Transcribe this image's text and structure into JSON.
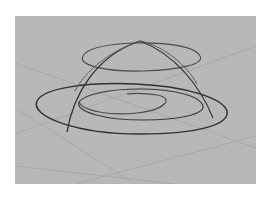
{
  "figure": {
    "colors": {
      "background": "#ffffff",
      "viewport": "#b7b8ba",
      "grid_line": "#a5a6a9",
      "curve_dark": "#2e2e30",
      "curve_mid": "#4a4a4d"
    },
    "elements": [
      {
        "name": "outer-spiral-ring",
        "kind": "ellipse-like curve"
      },
      {
        "name": "middle-spiral-ring",
        "kind": "ellipse-like curve"
      },
      {
        "name": "inner-spiral-end",
        "kind": "spiral hook"
      },
      {
        "name": "upper-dome-ellipse",
        "kind": "elevated ellipse"
      },
      {
        "name": "dome-arc-left",
        "kind": "arc"
      },
      {
        "name": "dome-arc-right",
        "kind": "arc"
      },
      {
        "name": "construction-plane-grid",
        "kind": "grid lines"
      }
    ]
  }
}
